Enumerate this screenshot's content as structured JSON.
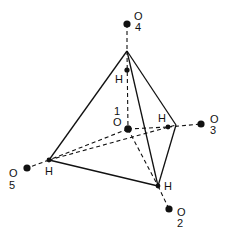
{
  "figure": {
    "central_atom": {
      "element": "O",
      "index": "1"
    },
    "atoms": [
      {
        "id": "O4",
        "element": "O",
        "index": "4"
      },
      {
        "id": "O3",
        "element": "O",
        "index": "3"
      },
      {
        "id": "O5",
        "element": "O",
        "index": "5"
      },
      {
        "id": "O2",
        "element": "O",
        "index": "2"
      },
      {
        "id": "H_top",
        "element": "H"
      },
      {
        "id": "H_right",
        "element": "H"
      },
      {
        "id": "H_left",
        "element": "H"
      },
      {
        "id": "H_bottom",
        "element": "H"
      }
    ],
    "labels": {
      "o_letter": "O",
      "h_letter": "H",
      "idx1": "1",
      "idx2": "2",
      "idx3": "3",
      "idx4": "4",
      "idx5": "5"
    },
    "colors": {
      "ink": "#111111",
      "background": "#ffffff"
    }
  }
}
